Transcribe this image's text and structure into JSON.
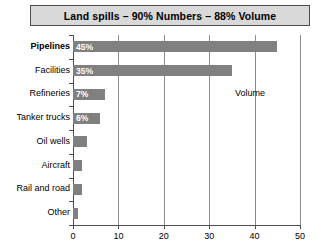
{
  "chart_data": {
    "type": "bar",
    "orientation": "horizontal",
    "title": "Land spills – 90% Numbers – 88% Volume",
    "xlabel": "",
    "ylabel": "",
    "xlim": [
      0,
      50
    ],
    "xticks": [
      0,
      10,
      20,
      30,
      40,
      50
    ],
    "grid": true,
    "legend": false,
    "categories": [
      "Other",
      "Rail and road",
      "Aircraft",
      "Oil wells",
      "Tanker trucks",
      "Refineries",
      "Facilities",
      "Pipelines"
    ],
    "values": [
      1,
      2,
      2,
      3,
      6,
      7,
      35,
      45
    ],
    "data_labels": [
      "",
      "",
      "",
      "",
      "6%",
      "7%",
      "35%",
      "45%"
    ],
    "annotations": [
      {
        "text": "Volume",
        "x": 39,
        "category": "Refineries"
      }
    ],
    "emphasized_category": "Pipelines",
    "bar_color": "#808080",
    "title_bg_color": "#d9d9d9",
    "title_border_color": "#4d4d4d",
    "axis_color": "#4d4d4d",
    "gridline_color": "#8c8c8c",
    "data_label_color": "#ffffff"
  }
}
